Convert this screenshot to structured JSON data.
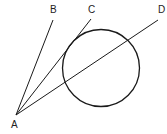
{
  "diagram": {
    "type": "geometry",
    "stroke_color": "#1a1a1a",
    "circle": {
      "cx": 101,
      "cy": 68,
      "r": 38.5
    },
    "vertex": {
      "label": "A",
      "x": 16,
      "y": 115,
      "label_x": 11,
      "label_y": 128
    },
    "rays": [
      {
        "label": "B",
        "x2": 53,
        "y2": 20,
        "label_x": 50,
        "label_y": 13,
        "relation": "outside circle"
      },
      {
        "label": "C",
        "x2": 91,
        "y2": 19,
        "label_x": 88,
        "label_y": 13,
        "relation": "tangent to circle"
      },
      {
        "label": "D",
        "x2": 158,
        "y2": 20,
        "label_x": 158,
        "label_y": 13,
        "relation": "secant through circle"
      }
    ]
  }
}
